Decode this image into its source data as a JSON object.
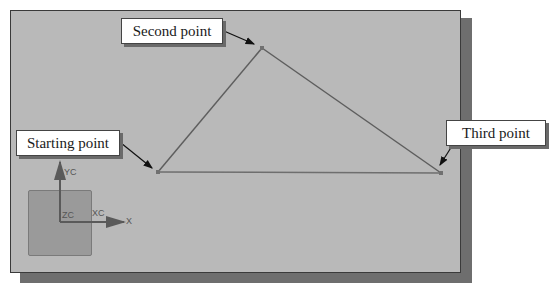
{
  "diagram": {
    "type": "cad-sketch-polyline",
    "colors": {
      "canvas_bg": "#b9b9b9",
      "canvas_border": "#3a3a3a",
      "shadow": "#6e6e6e",
      "line": "#5a5a5a",
      "callout_bg": "#ffffff"
    },
    "points": [
      {
        "id": "start",
        "label": "Starting point",
        "x": 158,
        "y": 172
      },
      {
        "id": "second",
        "label": "Second point",
        "x": 262,
        "y": 48
      },
      {
        "id": "third",
        "label": "Third point",
        "x": 441,
        "y": 173
      }
    ],
    "callouts": {
      "second": "Second point",
      "start": "Starting point",
      "third": "Third point"
    },
    "axes": {
      "yc_label": "YC",
      "zc_label": "ZC",
      "xc_label": "XC",
      "x_label": "X"
    }
  }
}
